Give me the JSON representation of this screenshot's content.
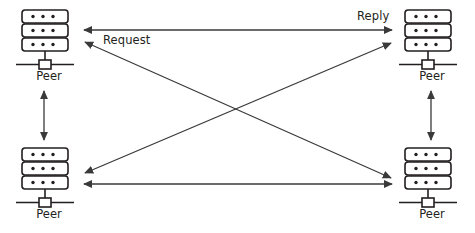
{
  "diagram": {
    "background_color": "#ffffff",
    "stroke_color": "#231f20",
    "line_color": "#3a3a3a",
    "nodes": [
      {
        "id": "peer-top-left",
        "label": "Peer",
        "icon": "server-stack-icon",
        "position": "top-left",
        "x": 22,
        "y": 10
      },
      {
        "id": "peer-top-right",
        "label": "Peer",
        "icon": "server-stack-icon",
        "position": "top-right",
        "x": 405,
        "y": 10
      },
      {
        "id": "peer-bottom-left",
        "label": "Peer",
        "icon": "server-stack-icon",
        "position": "bottom-left",
        "x": 22,
        "y": 148
      },
      {
        "id": "peer-bottom-right",
        "label": "Peer",
        "icon": "server-stack-icon",
        "position": "bottom-right",
        "x": 405,
        "y": 148
      }
    ],
    "edges": [
      {
        "id": "edge-top-horizontal",
        "from": "peer-top-left",
        "to": "peer-top-right",
        "arrowheads": "both",
        "orientation": "horizontal",
        "labels": [
          "Request",
          "Reply"
        ]
      },
      {
        "id": "edge-bottom-horizontal",
        "from": "peer-bottom-left",
        "to": "peer-bottom-right",
        "arrowheads": "both",
        "orientation": "horizontal",
        "labels": []
      },
      {
        "id": "edge-left-vertical",
        "from": "peer-top-left",
        "to": "peer-bottom-left",
        "arrowheads": "both",
        "orientation": "vertical",
        "labels": []
      },
      {
        "id": "edge-right-vertical",
        "from": "peer-top-right",
        "to": "peer-bottom-right",
        "arrowheads": "both",
        "orientation": "vertical",
        "labels": []
      },
      {
        "id": "edge-diagonal-tl-br",
        "from": "peer-top-left",
        "to": "peer-bottom-right",
        "arrowheads": "both",
        "orientation": "diagonal",
        "labels": []
      },
      {
        "id": "edge-diagonal-bl-tr",
        "from": "peer-bottom-left",
        "to": "peer-top-right",
        "arrowheads": "both",
        "orientation": "diagonal",
        "labels": []
      }
    ],
    "labels": {
      "request": "Request",
      "reply": "Reply",
      "peer": "Peer"
    }
  }
}
